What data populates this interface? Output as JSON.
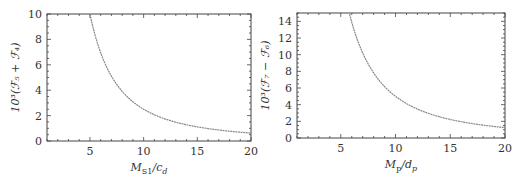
{
  "chart_data": [
    {
      "type": "line",
      "title": "",
      "xlabel": "M_S1/c_d",
      "ylabel": "10^3(F_5 + F_4)",
      "xlim": [
        1,
        20
      ],
      "ylim": [
        0,
        10
      ],
      "xticks": [
        5,
        10,
        15,
        20
      ],
      "yticks": [
        0,
        2,
        4,
        6,
        8,
        10
      ],
      "grid": false,
      "series": [
        {
          "name": "10^3(F_5 + F_4)",
          "x": [
            5,
            6,
            7,
            8,
            9,
            10,
            12,
            14,
            16,
            18,
            20
          ],
          "y": [
            10.0,
            6.9,
            5.1,
            3.9,
            3.1,
            2.5,
            1.74,
            1.28,
            0.98,
            0.77,
            0.62
          ]
        }
      ]
    },
    {
      "type": "line",
      "title": "",
      "xlabel": "M_p/d_p",
      "ylabel": "10^3(F_7 - F_6)",
      "xlim": [
        1,
        20
      ],
      "ylim": [
        0,
        15
      ],
      "xticks": [
        5,
        10,
        15,
        20
      ],
      "yticks": [
        0,
        2,
        4,
        6,
        8,
        10,
        12,
        14
      ],
      "grid": false,
      "series": [
        {
          "name": "10^3(F_7 - F_6)",
          "x": [
            5.8,
            6,
            7,
            8,
            9,
            10,
            12,
            14,
            16,
            18,
            20
          ],
          "y": [
            15.0,
            13.9,
            10.2,
            7.8,
            6.2,
            5.0,
            3.5,
            2.55,
            1.95,
            1.55,
            1.25
          ]
        }
      ]
    }
  ],
  "left_chart": {
    "y_label": "10³(ℱ₅ + ℱ₄)",
    "x_label": "M",
    "x_label_sub": "S1",
    "x_label_rest": "/c",
    "x_label_sub2": "d",
    "x_ticks": [
      "5",
      "10",
      "15",
      "20"
    ],
    "y_ticks": [
      "0",
      "2",
      "4",
      "6",
      "8",
      "10"
    ]
  },
  "right_chart": {
    "y_label": "10³(ℱ₇ − ℱ₆)",
    "x_label": "M",
    "x_label_sub": "p",
    "x_label_rest": "/d",
    "x_label_sub2": "p",
    "x_ticks": [
      "5",
      "10",
      "15",
      "20"
    ],
    "y_ticks": [
      "0",
      "2",
      "4",
      "6",
      "8",
      "10",
      "12",
      "14"
    ]
  },
  "colors": {
    "curve": "#888888",
    "frame": "#444444",
    "text": "#333333"
  }
}
